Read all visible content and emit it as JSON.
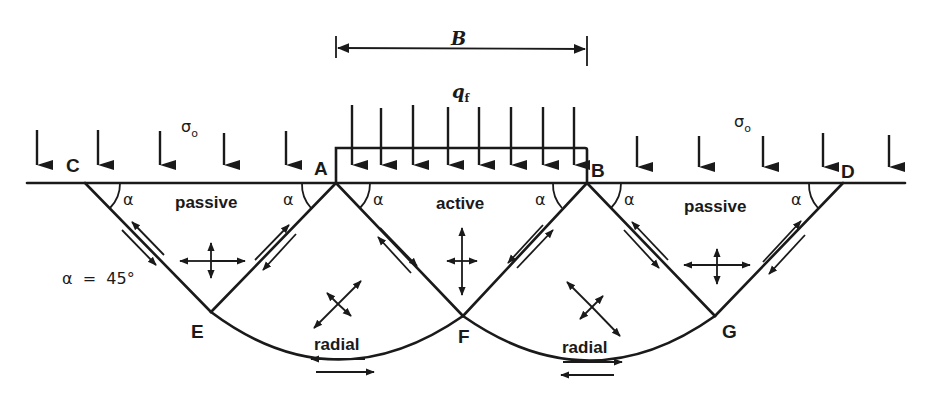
{
  "figure": {
    "dimension_label": "B",
    "footing_load_label": "q",
    "footing_load_subscript": "f",
    "surcharge_label": "σ",
    "surcharge_subscript": "o",
    "angle_label": "α",
    "angle_note": "α  =  45°"
  },
  "points": {
    "A": "A",
    "B": "B",
    "C": "C",
    "D": "D",
    "E": "E",
    "F": "F",
    "G": "G"
  },
  "zones": {
    "left_passive": "passive",
    "active": "active",
    "right_passive": "passive",
    "left_radial": "radial",
    "right_radial": "radial"
  },
  "colors": {
    "ink": "#1a1a1a",
    "background": "#ffffff"
  }
}
